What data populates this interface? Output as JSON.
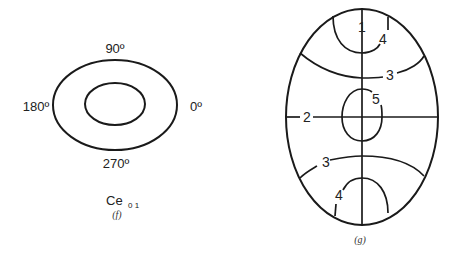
{
  "figure_f": {
    "labels": {
      "top": "90º",
      "left": "180º",
      "right": "0º",
      "bottom": "270º"
    },
    "mode_label": "Ce",
    "mode_subscript": "0 1",
    "caption": "(f)"
  },
  "figure_g": {
    "region_labels": {
      "top_center": "1",
      "top_right": "4",
      "upper_arc": "3",
      "center": "5",
      "left_axis": "2",
      "lower_arc": "3",
      "bottom_left": "4"
    },
    "caption": "(g)"
  }
}
